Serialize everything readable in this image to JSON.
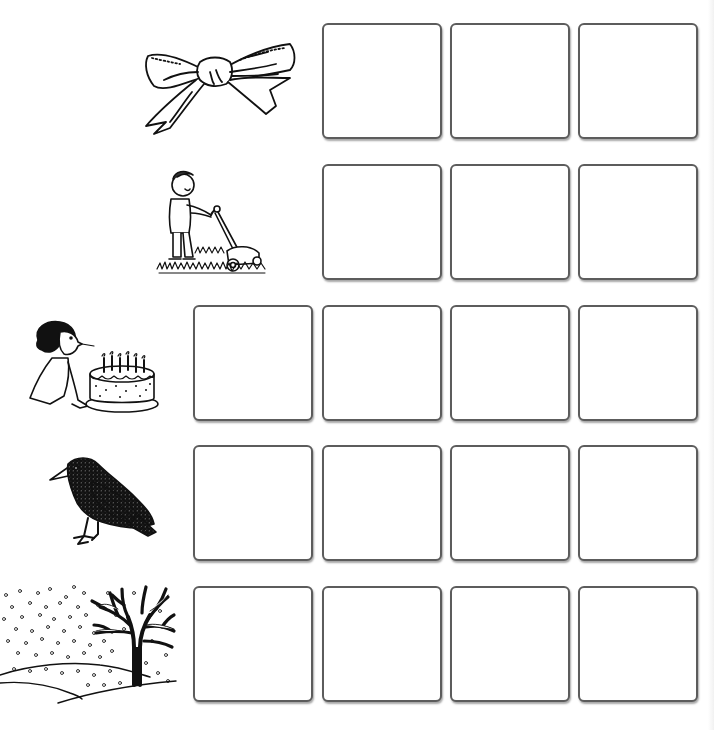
{
  "worksheet": {
    "type": "picture-word sound boxes worksheet",
    "box_border_color": "#5c5c5c",
    "background_color": "#ffffff",
    "rows": [
      {
        "picture": "bow",
        "picture_icon": "bow-icon",
        "box_count": 3,
        "boxes": [
          "",
          "",
          ""
        ]
      },
      {
        "picture": "mow",
        "picture_icon": "boy-mowing-lawn-icon",
        "box_count": 3,
        "boxes": [
          "",
          "",
          ""
        ]
      },
      {
        "picture": "blow",
        "picture_icon": "girl-blowing-candles-icon",
        "box_count": 4,
        "boxes": [
          "",
          "",
          "",
          ""
        ]
      },
      {
        "picture": "crow",
        "picture_icon": "crow-bird-icon",
        "box_count": 4,
        "boxes": [
          "",
          "",
          "",
          ""
        ]
      },
      {
        "picture": "snow",
        "picture_icon": "snowy-tree-landscape-icon",
        "box_count": 4,
        "boxes": [
          "",
          "",
          "",
          ""
        ]
      }
    ]
  }
}
